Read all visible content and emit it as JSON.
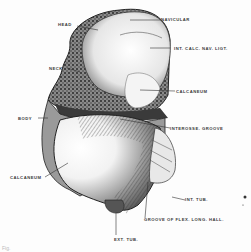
{
  "figure": {
    "labels": {
      "head": "HEAD",
      "navicular": "NAVICULAR",
      "int_calc_nav_ligt": "INT. CALC. NAV. LIGT.",
      "neck": "NECK",
      "calcaneum_upper": "CALCANEUM",
      "body": "BODY",
      "interosse_groove": "INTEROSSE. GROOVE",
      "calcaneum_lower": "CALCANEUM",
      "int_tub": "INT. TUB.",
      "groove_flex": "GROOVE OF FLEX. LONG. HALL.",
      "ext_tub": "EXT. TUB."
    },
    "caption": "Fig."
  },
  "colors": {
    "ink": "#2a2a2a",
    "paper": "#fdfdfd",
    "shade": "#6e6e6e"
  }
}
